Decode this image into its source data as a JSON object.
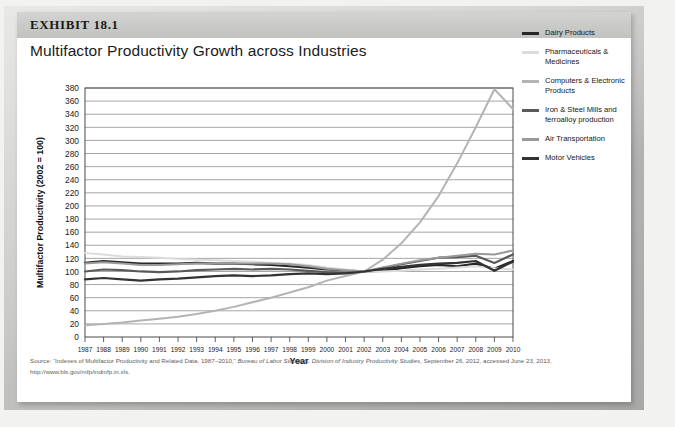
{
  "exhibit": {
    "number_label": "EXHIBIT 18.1",
    "title": "Multifactor Productivity Growth across Industries"
  },
  "source": {
    "line1_prefix": "Source: “Indexes of Multifactor Productivity and Related Data, 1987–2010,” ",
    "line1_italic1": "Bureau of Labor Statistics, Division of Industry Productivity Studies",
    "line1_suffix": ", September 26, 2012, accessed June 23, 2013,",
    "line2": "http://www.bls.gov/mfp/indmfp.in.xls."
  },
  "legend": {
    "items": [
      {
        "label": "Dairy Products",
        "color": "#262626"
      },
      {
        "label": "Pharmaceuticals & Medicines",
        "color": "#dcdcdc"
      },
      {
        "label": "Computers & Electronic Products",
        "color": "#b4b4b4"
      },
      {
        "label": "Iron & Steel Mills and ferroalloy production",
        "color": "#5a5a5a"
      },
      {
        "label": "Air Transportation",
        "color": "#9a9a9a"
      },
      {
        "label": "Motor Vehicles",
        "color": "#333333"
      }
    ]
  },
  "chart_data": {
    "type": "line",
    "title": "Multifactor Productivity Growth across Industries",
    "xlabel": "Year",
    "ylabel": "Multifactor Productivity (2002 = 100)",
    "xlim": [
      1987,
      2010
    ],
    "ylim": [
      0,
      380
    ],
    "ytick_step": 20,
    "grid": "horizontal",
    "legend_position": "right",
    "x": [
      1987,
      1988,
      1989,
      1990,
      1991,
      1992,
      1993,
      1994,
      1995,
      1996,
      1997,
      1998,
      1999,
      2000,
      2001,
      2002,
      2003,
      2004,
      2005,
      2006,
      2007,
      2008,
      2009,
      2010
    ],
    "yticks": [
      0,
      20,
      40,
      60,
      80,
      100,
      120,
      140,
      160,
      180,
      200,
      220,
      240,
      260,
      280,
      300,
      320,
      340,
      360,
      380
    ],
    "xticks": [
      1987,
      1988,
      1989,
      1990,
      1991,
      1992,
      1993,
      1994,
      1995,
      1996,
      1997,
      1998,
      1999,
      2000,
      2001,
      2002,
      2003,
      2004,
      2005,
      2006,
      2007,
      2008,
      2009,
      2010
    ],
    "series": [
      {
        "name": "Dairy Products",
        "color": "#262626",
        "width": 2.2,
        "values": [
          113,
          116,
          114,
          112,
          112,
          112,
          113,
          112,
          112,
          111,
          110,
          108,
          106,
          103,
          102,
          100,
          101,
          105,
          108,
          110,
          108,
          112,
          104,
          116
        ]
      },
      {
        "name": "Pharmaceuticals & Medicines",
        "color": "#dcdcdc",
        "width": 2.0,
        "values": [
          128,
          126,
          123,
          122,
          121,
          119,
          118,
          117,
          116,
          115,
          113,
          112,
          110,
          106,
          103,
          100,
          100,
          101,
          103,
          104,
          106,
          108,
          105,
          103
        ]
      },
      {
        "name": "Computers & Electronic Products",
        "color": "#b4b4b4",
        "width": 2.0,
        "values": [
          18,
          20,
          22,
          25,
          28,
          31,
          35,
          40,
          46,
          53,
          60,
          68,
          76,
          86,
          93,
          100,
          118,
          143,
          175,
          215,
          265,
          320,
          378,
          348
        ]
      },
      {
        "name": "Iron & Steel Mills and ferroalloy production",
        "color": "#5a5a5a",
        "width": 2.2,
        "values": [
          100,
          103,
          102,
          100,
          99,
          100,
          102,
          103,
          104,
          103,
          104,
          103,
          101,
          99,
          98,
          100,
          105,
          111,
          116,
          121,
          122,
          124,
          113,
          126
        ]
      },
      {
        "name": "Air Transportation",
        "color": "#9a9a9a",
        "width": 2.0,
        "values": [
          112,
          114,
          112,
          110,
          110,
          111,
          112,
          112,
          112,
          112,
          112,
          111,
          108,
          104,
          102,
          100,
          106,
          112,
          117,
          121,
          124,
          127,
          126,
          132
        ]
      },
      {
        "name": "Motor Vehicles",
        "color": "#333333",
        "width": 2.2,
        "values": [
          88,
          90,
          88,
          86,
          88,
          89,
          91,
          93,
          94,
          93,
          94,
          96,
          97,
          96,
          97,
          100,
          104,
          107,
          110,
          112,
          113,
          116,
          101,
          115
        ]
      }
    ]
  }
}
